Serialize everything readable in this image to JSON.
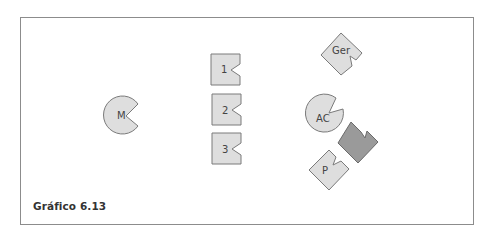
{
  "figure": {
    "caption": "Gráfico 6.13",
    "colors": {
      "light_fill": "#dedede",
      "dark_fill": "#9a9a9a",
      "stroke": "#7a7a7a",
      "frame": "#8c8c8c"
    },
    "shapes": {
      "m": {
        "label": "M",
        "type": "pacman-circle"
      },
      "one": {
        "label": "1",
        "type": "notched-square"
      },
      "two": {
        "label": "2",
        "type": "notched-square"
      },
      "three": {
        "label": "3",
        "type": "notched-square"
      },
      "ger": {
        "label": "Ger",
        "type": "notched-square-rotated"
      },
      "ac": {
        "label": "AC",
        "type": "pacman-circle"
      },
      "p": {
        "label": "P",
        "type": "notched-square-rotated"
      },
      "dark": {
        "label": "",
        "type": "notched-square-rotated-dark"
      }
    }
  }
}
